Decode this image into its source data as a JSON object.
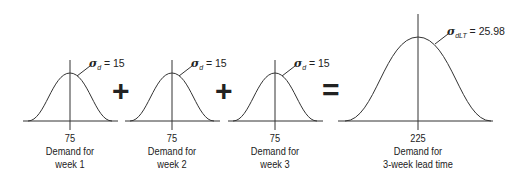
{
  "diagram": {
    "operators": {
      "plus": "+",
      "equals": "="
    },
    "weeks": [
      {
        "mean": "75",
        "label_line1": "Demand for",
        "label_line2": "week 1",
        "sigma_symbol": "σ",
        "sigma_sub": "d",
        "sigma_value": " = 15"
      },
      {
        "mean": "75",
        "label_line1": "Demand for",
        "label_line2": "week 2",
        "sigma_symbol": "σ",
        "sigma_sub": "d",
        "sigma_value": " = 15"
      },
      {
        "mean": "75",
        "label_line1": "Demand for",
        "label_line2": "week 3",
        "sigma_symbol": "σ",
        "sigma_sub": "d",
        "sigma_value": " = 15"
      }
    ],
    "result": {
      "mean": "225",
      "label_line1": "Demand for",
      "label_line2": "3-week lead time",
      "sigma_symbol": "σ",
      "sigma_sub": "dLT",
      "sigma_value": " = 25.98"
    }
  }
}
